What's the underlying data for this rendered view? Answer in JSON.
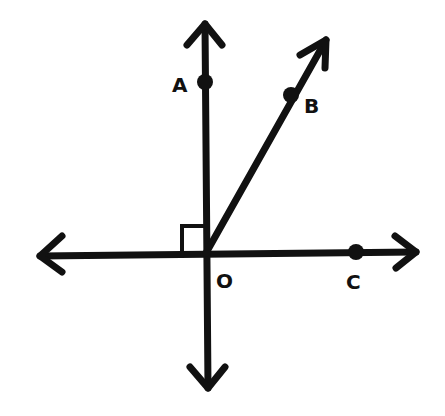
{
  "diagram": {
    "title": "",
    "points": [
      {
        "id": "A",
        "label": "A",
        "on": "vertical line (upward)"
      },
      {
        "id": "B",
        "label": "B",
        "on": "ray OB"
      },
      {
        "id": "C",
        "label": "C",
        "on": "horizontal line (rightward)"
      },
      {
        "id": "O",
        "label": "O",
        "on": "intersection"
      }
    ],
    "marks": [
      "right-angle between OA and left horizontal"
    ],
    "color": "#111111"
  }
}
